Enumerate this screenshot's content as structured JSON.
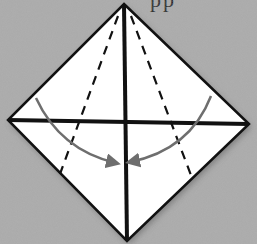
{
  "diagram": {
    "type": "origami-fold-step",
    "partial_caption": "pp",
    "colors": {
      "background": "#a9a9a9",
      "paper": "#ffffff",
      "edge": "#111111",
      "crease": "#111111",
      "arrow": "#6e6e6e"
    },
    "diamond": {
      "top": [
        124,
        4
      ],
      "right": [
        249,
        124
      ],
      "bottom": [
        127,
        241
      ],
      "left": [
        8,
        120
      ]
    },
    "creases": {
      "vertical": {
        "from": [
          124,
          4
        ],
        "to": [
          127,
          241
        ]
      },
      "horizontal": {
        "from": [
          8,
          120
        ],
        "to": [
          249,
          124
        ]
      }
    },
    "dashed_fold_lines": [
      {
        "name": "left-fold-line",
        "from": [
          118,
          16
        ],
        "to": [
          60,
          174
        ]
      },
      {
        "name": "right-fold-line",
        "from": [
          131,
          16
        ],
        "to": [
          192,
          178
        ]
      }
    ],
    "arrows": [
      {
        "name": "left-fold-arrow",
        "start": [
          36,
          98
        ],
        "control": [
          60,
          150
        ],
        "end": [
          116,
          163
        ]
      },
      {
        "name": "right-fold-arrow",
        "start": [
          211,
          96
        ],
        "control": [
          190,
          150
        ],
        "end": [
          130,
          162
        ]
      }
    ]
  }
}
